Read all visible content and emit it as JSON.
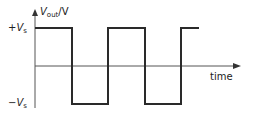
{
  "diagram": {
    "type": "square-wave",
    "y_axis_label": {
      "symbol": "V",
      "subscript": "out",
      "unit": "/V"
    },
    "x_axis_label": "time",
    "levels": [
      {
        "name": "positive",
        "sign": "+",
        "symbol": "V",
        "subscript": "s"
      },
      {
        "name": "negative",
        "sign": "−",
        "symbol": "V",
        "subscript": "s"
      }
    ],
    "waveform": {
      "start_level": "+Vs",
      "transitions": 4,
      "end_level": "+Vs"
    },
    "colors": {
      "wave": "#2a2a2a",
      "axis": "#555555",
      "text": "#222222"
    }
  }
}
